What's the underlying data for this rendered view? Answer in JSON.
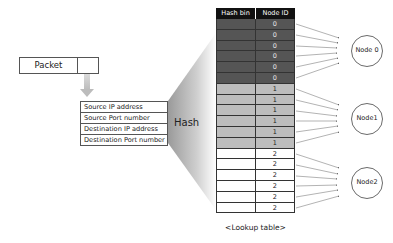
{
  "packet": {
    "label": "Packet"
  },
  "fields": [
    "Source IP address",
    "Source Port number",
    "Destination IP address",
    "Destination Port number"
  ],
  "hash": {
    "label": "Hash"
  },
  "lookup_table": {
    "headers": {
      "hash_bin": "Hash bin",
      "node_id": "Node ID"
    },
    "rows": [
      {
        "hash_bin": "",
        "node_id": "0"
      },
      {
        "hash_bin": "",
        "node_id": "0"
      },
      {
        "hash_bin": "",
        "node_id": "0"
      },
      {
        "hash_bin": "",
        "node_id": "0"
      },
      {
        "hash_bin": "",
        "node_id": "0"
      },
      {
        "hash_bin": "",
        "node_id": "0"
      },
      {
        "hash_bin": "",
        "node_id": "1"
      },
      {
        "hash_bin": "",
        "node_id": "1"
      },
      {
        "hash_bin": "",
        "node_id": "1"
      },
      {
        "hash_bin": "",
        "node_id": "1"
      },
      {
        "hash_bin": "",
        "node_id": "1"
      },
      {
        "hash_bin": "",
        "node_id": "1"
      },
      {
        "hash_bin": "",
        "node_id": "2"
      },
      {
        "hash_bin": "",
        "node_id": "2"
      },
      {
        "hash_bin": "",
        "node_id": "2"
      },
      {
        "hash_bin": "",
        "node_id": "2"
      },
      {
        "hash_bin": "",
        "node_id": "2"
      },
      {
        "hash_bin": "",
        "node_id": "2"
      }
    ],
    "caption": "<Lookup table>"
  },
  "nodes": [
    {
      "label": "Node 0"
    },
    {
      "label": "Node1"
    },
    {
      "label": "Node2"
    }
  ],
  "colors": {
    "node0_rows": "#555555",
    "node1_rows": "#bdbdbd",
    "node2_rows": "#ffffff",
    "header": "#111111"
  }
}
